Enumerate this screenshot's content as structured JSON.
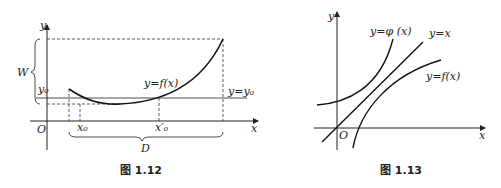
{
  "figures": [
    {
      "caption": "图 1.12",
      "labels": {
        "y_axis": "y",
        "x_axis": "x",
        "origin": "O",
        "range": "W",
        "y0": "y₀",
        "curve": "y=f(x)",
        "line": "y=y₀",
        "x0": "x₀",
        "x0_prime": "x′₀",
        "domain": "D"
      }
    },
    {
      "caption": "图 1.13",
      "labels": {
        "y_axis": "y",
        "x_axis": "x",
        "origin": "O",
        "curve_phi": "y=φ (x)",
        "line_identity": "y=x",
        "curve_f": "y=f(x)"
      }
    }
  ]
}
